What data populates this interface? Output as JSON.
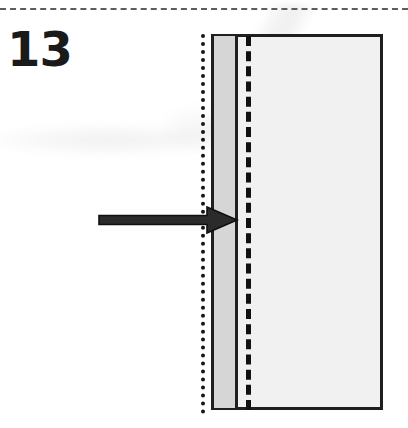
{
  "figure": {
    "number_label": "13",
    "caption": "",
    "type": "technical-cross-section-diagram"
  },
  "colors": {
    "page_background": "#ffffff",
    "body_fill": "#f1f1f1",
    "layer_fill": "#d6d6d6",
    "line_dark": "#1f1f1f",
    "ink_black": "#111111",
    "rule_gray": "#5d5d5d",
    "arrow_fill": "#2b2b2b"
  },
  "elements": {
    "top_rule": {
      "name": "top-dashed-rule",
      "style": "dashed",
      "orientation": "horizontal"
    },
    "section_rect": {
      "name": "section-rectangle",
      "style": "solid-outline",
      "fill": "#f1f1f1"
    },
    "grey_layer": {
      "name": "grey-layer-band",
      "style": "solid-fill",
      "fill": "#d6d6d6"
    },
    "layer_divider": {
      "name": "layer-divider-line",
      "style": "solid",
      "orientation": "vertical"
    },
    "interior_dashed": {
      "name": "interior-dashed-line",
      "style": "dashed",
      "orientation": "vertical"
    },
    "outer_dotted": {
      "name": "outer-dotted-boundary",
      "style": "dotted",
      "orientation": "vertical"
    },
    "arrow": {
      "name": "annotation-arrow",
      "direction": "right",
      "points_to": "grey-layer-band"
    }
  }
}
